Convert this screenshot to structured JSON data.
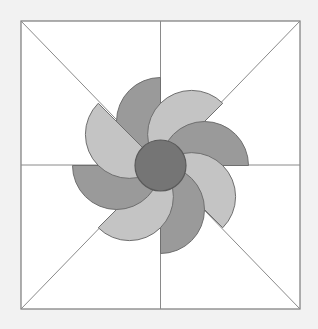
{
  "figure": {
    "canvas": {
      "width": 318,
      "height": 329
    },
    "background_color": "#f2f2f2",
    "frame": {
      "name": "square-frame",
      "x": 21,
      "y": 21,
      "width": 279,
      "height": 288,
      "fill": "#ffffff",
      "stroke": "#7a7a7a",
      "stroke_width": 1.2
    },
    "guides": {
      "name": "construction-lines",
      "stroke": "#8a8a8a",
      "stroke_width": 1,
      "lines": [
        {
          "name": "diagonal-tl-br",
          "x1": 21,
          "y1": 21,
          "x2": 300,
          "y2": 309
        },
        {
          "name": "diagonal-tr-bl",
          "x1": 300,
          "y1": 21,
          "x2": 21,
          "y2": 309
        },
        {
          "name": "midline-horizontal",
          "x1": 21,
          "y1": 165,
          "x2": 300,
          "y2": 165
        },
        {
          "name": "midline-vertical",
          "x1": 160.5,
          "y1": 21,
          "x2": 160.5,
          "y2": 309
        }
      ]
    },
    "center": {
      "x": 160.5,
      "y": 165.5
    },
    "petal_radius": 88,
    "petal_count": 8,
    "petal_colors": {
      "dark": "#9a9a9a",
      "light": "#c4c4c4"
    },
    "petal_stroke": "#6f6f6f",
    "petal_stroke_width": 1,
    "petals": [
      {
        "name": "petal-1",
        "angle_deg": -90,
        "tone": "dark"
      },
      {
        "name": "petal-2",
        "angle_deg": -45,
        "tone": "light"
      },
      {
        "name": "petal-3",
        "angle_deg": 0,
        "tone": "dark"
      },
      {
        "name": "petal-4",
        "angle_deg": 45,
        "tone": "light"
      },
      {
        "name": "petal-5",
        "angle_deg": 90,
        "tone": "dark"
      },
      {
        "name": "petal-6",
        "angle_deg": 135,
        "tone": "light"
      },
      {
        "name": "petal-7",
        "angle_deg": 180,
        "tone": "dark"
      },
      {
        "name": "petal-8",
        "angle_deg": 225,
        "tone": "light"
      }
    ],
    "hub": {
      "name": "center-hub-circle",
      "cx": 160.5,
      "cy": 165.5,
      "r": 25.5,
      "fill": "#757575",
      "stroke": "#5a5a5a",
      "stroke_width": 1.2
    }
  }
}
